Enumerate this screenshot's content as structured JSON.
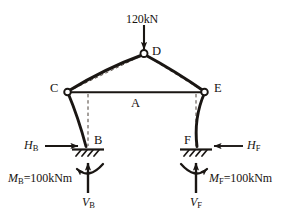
{
  "figure": {
    "type": "structural-free-body-diagram",
    "background_color": "#ffffff",
    "line_color": "#1a1613",
    "dashed_color": "#4a4038"
  },
  "applied_load": {
    "label": "120kN",
    "direction": "down",
    "applied_at_node": "D"
  },
  "nodes": [
    {
      "id": "D",
      "label": "D",
      "x": 144,
      "y": 53,
      "hinge": true,
      "label_x": 152,
      "label_y": 45
    },
    {
      "id": "C",
      "label": "C",
      "x": 67,
      "y": 92,
      "hinge": true,
      "label_x": 50,
      "label_y": 82
    },
    {
      "id": "E",
      "label": "E",
      "x": 205,
      "y": 92,
      "hinge": true,
      "label_x": 214,
      "label_y": 82
    },
    {
      "id": "A",
      "label": "A",
      "x": 136,
      "y": 94,
      "hinge": false,
      "label_x": 131,
      "label_y": 97
    },
    {
      "id": "B",
      "label": "B",
      "x": 88,
      "y": 149,
      "hinge": false,
      "label_x": 94,
      "label_y": 136
    },
    {
      "id": "F",
      "label": "F",
      "x": 196,
      "y": 149,
      "hinge": false,
      "label_x": 184,
      "label_y": 136
    }
  ],
  "supports": [
    {
      "id": "support-b",
      "node": "B",
      "kind": "fixed-hatched",
      "x": 88,
      "y": 149
    },
    {
      "id": "support-f",
      "node": "F",
      "kind": "fixed-hatched",
      "x": 196,
      "y": 149
    }
  ],
  "reactions": {
    "horizontal": [
      {
        "id": "H_B",
        "var": "H",
        "sub": "B",
        "node": "B",
        "direction": "right",
        "label_x": 24,
        "label_y": 144
      },
      {
        "id": "H_F",
        "var": "H",
        "sub": "F",
        "node": "F",
        "direction": "left",
        "label_x": 247,
        "label_y": 144
      }
    ],
    "vertical": [
      {
        "id": "V_B",
        "var": "V",
        "sub": "B",
        "node": "B",
        "direction": "up",
        "label_x": 83,
        "label_y": 199
      },
      {
        "id": "V_F",
        "var": "V",
        "sub": "F",
        "node": "F",
        "direction": "up",
        "label_x": 191,
        "label_y": 199
      }
    ],
    "moments": [
      {
        "id": "M_B",
        "var": "M",
        "sub": "B",
        "equals": "=",
        "value": "100kNm",
        "full_text": "MB=100kNm",
        "node": "B",
        "arc_sense": "arrowhead-left",
        "label_x": 10,
        "label_y": 177
      },
      {
        "id": "M_F",
        "var": "M",
        "sub": "F",
        "equals": "=",
        "value": "100kNm",
        "full_text": "MF=100kNm",
        "node": "F",
        "arc_sense": "arrowhead-right",
        "label_x": 208,
        "label_y": 177
      }
    ]
  },
  "members": [
    {
      "id": "rafter-c-d",
      "from": "C",
      "to": "D",
      "style": "thick-deflected",
      "chord_dashed": true
    },
    {
      "id": "rafter-d-e",
      "from": "D",
      "to": "E",
      "style": "thick-deflected",
      "chord_dashed": true
    },
    {
      "id": "tie-c-e",
      "from": "C",
      "to": "E",
      "style": "thin-straight",
      "chord_dashed": false
    },
    {
      "id": "column-c-b",
      "from": "C",
      "to": "B",
      "style": "thick-deflected",
      "chord_dashed": true
    },
    {
      "id": "column-e-f",
      "from": "E",
      "to": "F",
      "style": "thick-deflected",
      "chord_dashed": true
    }
  ]
}
